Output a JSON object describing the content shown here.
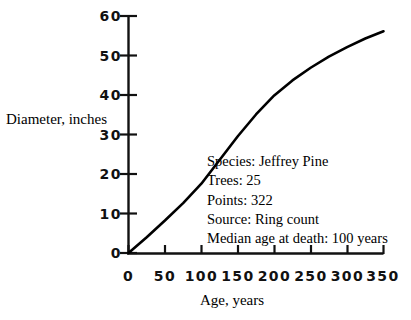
{
  "chart_data": {
    "type": "line",
    "title": "",
    "xlabel": "Age, years",
    "ylabel": "Diameter, inches",
    "xlim": [
      0,
      350
    ],
    "ylim": [
      0,
      60
    ],
    "xticks": [
      0,
      50,
      100,
      150,
      200,
      250,
      300,
      350
    ],
    "yticks": [
      0,
      10,
      20,
      30,
      40,
      50,
      60
    ],
    "grid": false,
    "legend": "none",
    "line_color": "#000000",
    "series": [
      {
        "name": "Jeffrey Pine diameter growth",
        "x": [
          0,
          25,
          50,
          75,
          100,
          125,
          150,
          175,
          200,
          225,
          250,
          275,
          300,
          325,
          350
        ],
        "values": [
          0,
          4.0,
          8.2,
          12.6,
          17.5,
          23.5,
          29.5,
          35.0,
          39.8,
          43.6,
          46.8,
          49.6,
          52.0,
          54.2,
          56.0
        ]
      }
    ],
    "annotations": [
      "Species: Jeffrey Pine",
      "Trees: 25",
      "Points: 322",
      "Source: Ring count",
      "Median age at death: 100 years"
    ]
  },
  "axes": {
    "y_tick_labels": [
      "60",
      "50",
      "40",
      "30",
      "20",
      "10",
      "0"
    ],
    "x_tick_labels": [
      "0",
      "50",
      "100",
      "150",
      "200",
      "250",
      "300",
      "350"
    ],
    "y_title": "Diameter, inches",
    "x_title": "Age, years"
  },
  "annotation": {
    "line1": "Species: Jeffrey Pine",
    "line2": "Trees: 25",
    "line3": "Points: 322",
    "line4": "Source: Ring count",
    "line5": "Median age at death: 100 years"
  },
  "colors": {
    "background": "#ffffff",
    "ink": "#000000",
    "curve": "#000000"
  }
}
